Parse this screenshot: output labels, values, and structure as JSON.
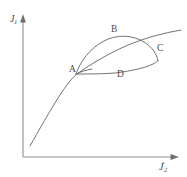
{
  "figure": {
    "type": "line-diagram",
    "background_color": "#ffffff",
    "curve_color": "#6a6a6a",
    "axis_color": "#8d8d8d",
    "text_color": "#4a4a4a",
    "axes": {
      "y": {
        "name": "J-one-axis",
        "symbol": "J",
        "subscript": "1",
        "prime": "",
        "label_text": "J",
        "direction": "up",
        "arrow": true
      },
      "x": {
        "name": "J-two-prime-axis",
        "symbol": "J",
        "subscript": "2",
        "prime": "'",
        "label_text": "J",
        "direction": "right",
        "arrow": true
      }
    },
    "point_labels": [
      {
        "id": "A",
        "text": "A",
        "role": "cusp-left",
        "x": 72,
        "y": 71
      },
      {
        "id": "B",
        "text": "B",
        "role": "upper-branch",
        "x": 114,
        "y": 31
      },
      {
        "id": "C",
        "text": "C",
        "role": "right-crossing",
        "x": 157,
        "y": 46
      },
      {
        "id": "D",
        "text": "D",
        "role": "lower-branch",
        "x": 119,
        "y": 71
      }
    ],
    "curves": [
      {
        "id": "background-curve",
        "name": "monotonic-background-curve",
        "description": "Smooth increasing curve rising from lower left through point A and continuing past C to the upper right."
      },
      {
        "id": "upper-loop",
        "name": "upper-loop-branch-ABC",
        "description": "Branch leaving cusp A, arching up through B and descending to C."
      },
      {
        "id": "lower-loop",
        "name": "lower-loop-branch-ADC",
        "description": "Branch leaving cusp A, dipping through D and rising to C, closing the loop."
      }
    ]
  }
}
